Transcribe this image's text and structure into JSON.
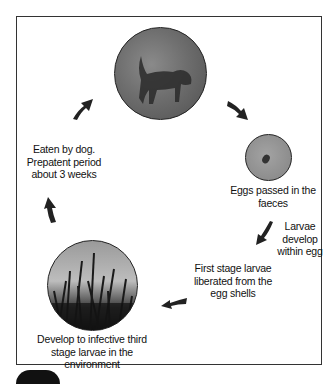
{
  "diagram": {
    "type": "life-cycle",
    "nodes": [
      {
        "id": "dog",
        "image": "dog-photo",
        "label": ""
      },
      {
        "id": "egg",
        "image": "egg-micrograph",
        "label": "Eggs passed in the faeces"
      },
      {
        "id": "grass",
        "image": "grass-photo",
        "label_lines": [
          "Develop to infective third",
          "stage larvae in the environment"
        ]
      }
    ],
    "steps": {
      "larvae_develop": [
        "Larvae",
        "develop",
        "within egg"
      ],
      "first_stage": [
        "First stage larvae",
        "liberated from the",
        "egg shells"
      ],
      "eaten": [
        "Eaten by dog.",
        "Prepatent period",
        "about 3 weeks"
      ]
    },
    "labels": {
      "eggs": "Eggs passed in the faeces",
      "grass_1": "Develop to infective third",
      "grass_2": "stage larvae in the environment"
    }
  }
}
